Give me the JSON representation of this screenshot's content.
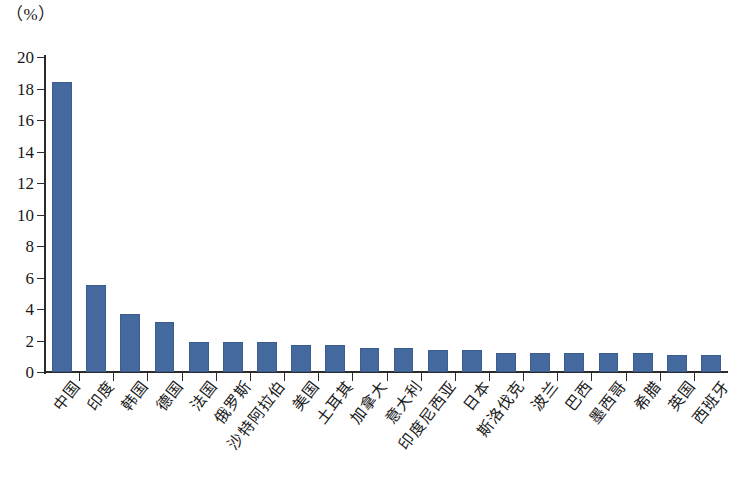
{
  "chart_data": {
    "type": "bar",
    "title": "",
    "subtitle": "",
    "xlabel": "",
    "ylabel": "",
    "unit_caption": "（%）",
    "ylim": [
      0,
      20
    ],
    "y_ticks": [
      0,
      2,
      4,
      6,
      8,
      10,
      12,
      14,
      16,
      18,
      20
    ],
    "y_tick_labels": [
      "0",
      "2",
      "4",
      "6",
      "8",
      "10",
      "12",
      "14",
      "16",
      "18",
      "20"
    ],
    "grid": false,
    "legend": null,
    "legend_position": "none",
    "series_color": "#44699f",
    "axis_color": "#2b2b2b",
    "categories": [
      "中国",
      "印度",
      "韩国",
      "德国",
      "法国",
      "俄罗斯",
      "沙特阿拉伯",
      "美国",
      "土耳其",
      "加拿大",
      "意大利",
      "印度尼西亚",
      "日本",
      "斯洛伐克",
      "波兰",
      "巴西",
      "墨西哥",
      "希腊",
      "英国",
      "西班牙"
    ],
    "values": [
      18.4,
      5.5,
      3.7,
      3.2,
      1.9,
      1.9,
      1.9,
      1.7,
      1.7,
      1.5,
      1.5,
      1.4,
      1.4,
      1.2,
      1.2,
      1.2,
      1.2,
      1.2,
      1.1,
      1.1
    ]
  }
}
